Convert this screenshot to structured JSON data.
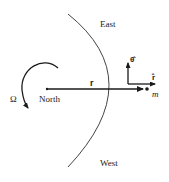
{
  "diagram": {
    "type": "physics-rotating-frame",
    "labels": {
      "east": "East",
      "west": "West",
      "north": "North",
      "omega": "Ω",
      "r_vector": "r",
      "theta_hat": "θ̂",
      "r_hat": "r̂",
      "mass": "m"
    },
    "colors": {
      "ink": "#1a1a1a",
      "arc": "#444444",
      "background": "#ffffff"
    }
  }
}
